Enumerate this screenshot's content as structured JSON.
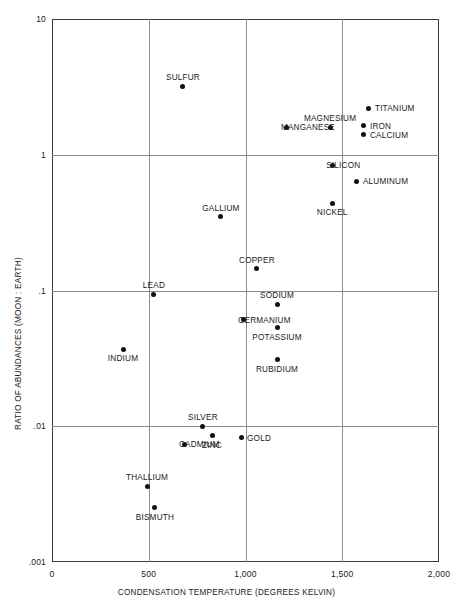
{
  "chart_data": {
    "type": "scatter",
    "title": "",
    "xlabel": "CONDENSATION TEMPERATURE (DEGREES KELVIN)",
    "ylabel": "RATIO OF ABUNDANCES (MOON : EARTH)",
    "xlim": [
      0,
      2000
    ],
    "ylim": [
      0.001,
      10
    ],
    "yscale": "log",
    "xscale": "linear",
    "grid": true,
    "legend": "none",
    "xticks": [
      {
        "value": 0,
        "label": "0"
      },
      {
        "value": 500,
        "label": "500"
      },
      {
        "value": 1000,
        "label": "1,000"
      },
      {
        "value": 1500,
        "label": "1,500"
      },
      {
        "value": 2000,
        "label": "2,000"
      }
    ],
    "yticks": [
      {
        "value": 10,
        "label": "10"
      },
      {
        "value": 1,
        "label": "1"
      },
      {
        "value": 0.1,
        "label": ".1"
      },
      {
        "value": 0.01,
        "label": ".01"
      },
      {
        "value": 0.001,
        "label": ".001"
      }
    ],
    "points": [
      {
        "name": "SULFUR",
        "x": 677,
        "y": 3.2,
        "label_pos": "above"
      },
      {
        "name": "TITANIUM",
        "x": 1638,
        "y": 2.2,
        "label_pos": "right"
      },
      {
        "name": "MAGNESIUM",
        "x": 1437,
        "y": 1.6,
        "label_pos": "above"
      },
      {
        "name": "IRON",
        "x": 1612,
        "y": 1.63,
        "label_pos": "right"
      },
      {
        "name": "CALCIUM",
        "x": 1612,
        "y": 1.4,
        "label_pos": "right"
      },
      {
        "name": "MANGANESE",
        "x": 1214,
        "y": 1.6,
        "label_pos": "left"
      },
      {
        "name": "SILICON",
        "x": 1448,
        "y": 0.84,
        "label_pos": "left"
      },
      {
        "name": "ALUMINUM",
        "x": 1576,
        "y": 0.64,
        "label_pos": "right"
      },
      {
        "name": "NICKEL",
        "x": 1448,
        "y": 0.44,
        "label_pos": "below"
      },
      {
        "name": "GALLIUM",
        "x": 873,
        "y": 0.35,
        "label_pos": "above"
      },
      {
        "name": "COPPER",
        "x": 1059,
        "y": 0.145,
        "label_pos": "above"
      },
      {
        "name": "LEAD",
        "x": 527,
        "y": 0.094,
        "label_pos": "above"
      },
      {
        "name": "SODIUM",
        "x": 1163,
        "y": 0.079,
        "label_pos": "above"
      },
      {
        "name": "GERMANIUM",
        "x": 992,
        "y": 0.061,
        "label_pos": "left"
      },
      {
        "name": "POTASSIUM",
        "x": 1163,
        "y": 0.053,
        "label_pos": "below"
      },
      {
        "name": "RUBIDIUM",
        "x": 1163,
        "y": 0.031,
        "label_pos": "below"
      },
      {
        "name": "INDIUM",
        "x": 367,
        "y": 0.037,
        "label_pos": "below"
      },
      {
        "name": "SILVER",
        "x": 780,
        "y": 0.01,
        "label_pos": "above"
      },
      {
        "name": "GOLD",
        "x": 977,
        "y": 0.0082,
        "label_pos": "right"
      },
      {
        "name": "ZINC",
        "x": 827,
        "y": 0.0085,
        "label_pos": "below"
      },
      {
        "name": "CADMIUM",
        "x": 687,
        "y": 0.0074,
        "label_pos": "left"
      },
      {
        "name": "THALLIUM",
        "x": 491,
        "y": 0.0036,
        "label_pos": "above"
      },
      {
        "name": "BISMUTH",
        "x": 532,
        "y": 0.0025,
        "label_pos": "below"
      }
    ]
  },
  "colors": {
    "point": "#111111",
    "frame": "#3b3b3b",
    "grid": "#8c8c8c",
    "text": "#1a1a1a",
    "background": "#ffffff"
  }
}
